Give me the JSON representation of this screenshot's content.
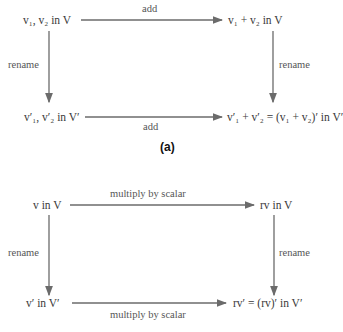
{
  "diagram_a": {
    "caption": "(a)",
    "top_left": "v₁, v₂ in V",
    "top_right": "v₁ + v₂ in V",
    "bottom_left": "v′₁, v′₂ in V′",
    "bottom_right": "v′₁ + v′₂ = (v₁ + v₂)′ in V′",
    "top_arrow_label": "add",
    "bottom_arrow_label": "add",
    "left_arrow_label": "rename",
    "right_arrow_label": "rename"
  },
  "diagram_b": {
    "top_left": "v in V",
    "top_right": "rv in V",
    "bottom_left": "v′ in V′",
    "bottom_right": "rv′ = (rv)′ in V′",
    "top_arrow_label": "multiply by scalar",
    "bottom_arrow_label": "multiply by scalar",
    "left_arrow_label": "rename",
    "right_arrow_label": "rename"
  },
  "colors": {
    "arrow": "#6b6b6b",
    "text": "#3a3a3a"
  }
}
